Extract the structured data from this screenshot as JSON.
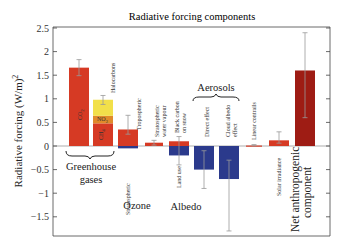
{
  "chart_data": {
    "type": "bar",
    "title": "Radiative forcing components",
    "xlabel": "",
    "ylabel": "Radiative forcing (W/m)²",
    "ylim": [
      -1.8,
      2.5
    ],
    "yticks": [
      2.5,
      2,
      1.5,
      1,
      0.5,
      0,
      -0.5,
      -1,
      -1.5
    ],
    "ytick_labels": [
      "2.5",
      "2",
      "1.5",
      "1",
      "0.5",
      "0",
      "−0.5",
      "−1",
      "−1.5"
    ],
    "grid": false,
    "colors": {
      "positive": "#d63a24",
      "negative": "#2b3a8c",
      "halocarbons": "#f2e04a",
      "no2": "#e08a2a",
      "net": "#9e1c14",
      "errorbar": "#999999"
    },
    "bars": [
      {
        "id": "co2",
        "label": "CO₂",
        "inside_label": true,
        "x": 79,
        "w": 20,
        "segments": [
          {
            "from": 0,
            "to": 1.66,
            "color": "positive"
          }
        ],
        "err": [
          1.49,
          1.83
        ]
      },
      {
        "id": "ch4-no2-halocarbons",
        "label": "Halocarbons",
        "x": 103,
        "w": 20,
        "segments": [
          {
            "from": 0,
            "to": 0.48,
            "color": "positive",
            "label": "CH₄"
          },
          {
            "from": 0.48,
            "to": 0.64,
            "color": "no2",
            "label": "NO₂"
          },
          {
            "from": 0.64,
            "to": 0.98,
            "color": "halocarbons"
          }
        ],
        "err": [
          0.88,
          1.07
        ]
      },
      {
        "id": "ozone",
        "label": "Tropospheric",
        "label_below": "Stratospheric",
        "x": 128,
        "w": 20,
        "segments": [
          {
            "from": 0,
            "to": 0.35,
            "color": "positive"
          },
          {
            "from": 0,
            "to": -0.05,
            "color": "negative"
          }
        ],
        "err": [
          0.25,
          0.65
        ]
      },
      {
        "id": "strat-water-vapour",
        "label": "Stratospheric water vapour",
        "x": 154,
        "w": 18,
        "segments": [
          {
            "from": 0,
            "to": 0.07,
            "color": "positive"
          }
        ],
        "err": [
          0.02,
          0.12
        ]
      },
      {
        "id": "albedo",
        "label": "Black carbon on snow",
        "label_below": "Land use",
        "x": 179,
        "w": 20,
        "segments": [
          {
            "from": 0,
            "to": 0.1,
            "color": "positive"
          },
          {
            "from": 0,
            "to": -0.2,
            "color": "negative"
          }
        ],
        "err": [
          -0.4,
          0.2
        ]
      },
      {
        "id": "direct-effect",
        "label": "Direct effect",
        "x": 204,
        "w": 20,
        "segments": [
          {
            "from": 0,
            "to": -0.5,
            "color": "negative"
          }
        ],
        "err": [
          -0.9,
          -0.1
        ]
      },
      {
        "id": "cloud-albedo",
        "label": "Cloud albedo effect",
        "x": 229,
        "w": 20,
        "segments": [
          {
            "from": 0,
            "to": -0.7,
            "color": "negative"
          }
        ],
        "err": [
          -1.8,
          -0.3
        ]
      },
      {
        "id": "linear-contrails",
        "label": "Linear contrails",
        "x": 254,
        "w": 16,
        "segments": [
          {
            "from": 0,
            "to": 0.01,
            "color": "positive"
          }
        ],
        "err": [
          0.003,
          0.03
        ]
      },
      {
        "id": "solar-irradiance",
        "label": "Solar irradiance",
        "label_below_only": true,
        "x": 279,
        "w": 20,
        "segments": [
          {
            "from": 0,
            "to": 0.12,
            "color": "positive"
          }
        ],
        "err": [
          0.06,
          0.3
        ]
      },
      {
        "id": "net-anthropogenic",
        "label": "Net anthropogenic component",
        "x": 305,
        "w": 20,
        "segments": [
          {
            "from": 0,
            "to": 1.6,
            "color": "net"
          }
        ],
        "err": [
          0.6,
          2.4
        ]
      }
    ],
    "groups": [
      {
        "label": "Greenhouse",
        "label2": "gases"
      },
      {
        "label": "Ozone"
      },
      {
        "label": "Albedo"
      },
      {
        "label": "Aerosols"
      },
      {
        "label": "Net anthropogenic",
        "label2": "component"
      }
    ]
  },
  "labels": {
    "title": "Radiative forcing components",
    "ylabel": "Radiative forcing (W/m)",
    "ylabel_sup": "2",
    "co2": "CO",
    "co2_sub": "2",
    "ch4": "CH",
    "ch4_sub": "4",
    "no2": "NO",
    "no2_sub": "2",
    "halocarbons": "Halocarbons",
    "tropospheric": "Tropospheric",
    "stratospheric": "Stratospheric",
    "strat_wv_1": "Stratospheric",
    "strat_wv_2": "water vapour",
    "bc_1": "Black carbon",
    "bc_2": "on snow",
    "land_use": "Land use",
    "direct": "Direct effect",
    "cloud_1": "Cloud albedo",
    "cloud_2": "effect",
    "contrails": "Linear contrails",
    "solar": "Solar irradiance",
    "ghg_1": "Greenhouse",
    "ghg_2": "gases",
    "ozone": "Ozone",
    "albedo": "Albedo",
    "aerosols": "Aerosols",
    "net_1": "Net anthropogenic",
    "net_2": "component",
    "ticks": [
      "2.5",
      "2",
      "1.5",
      "1",
      "0.5",
      "0",
      "−0.5",
      "−1",
      "−1.5"
    ]
  }
}
